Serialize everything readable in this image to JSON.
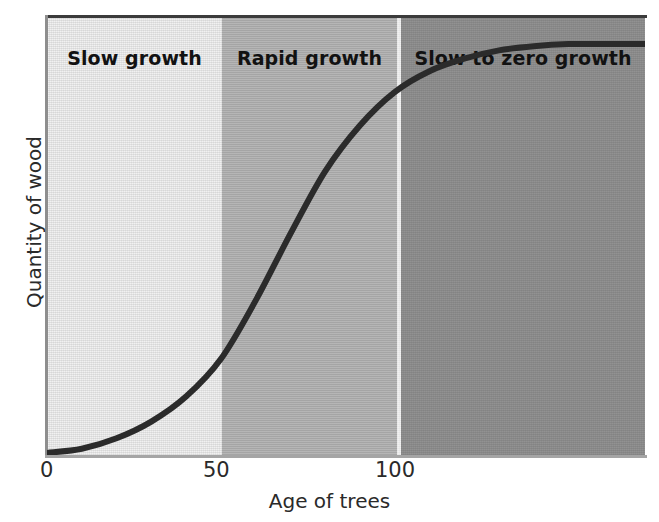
{
  "chart_data": {
    "type": "line",
    "title": "",
    "xlabel": "Age of trees",
    "ylabel": "Quantity of wood",
    "xlim": [
      0,
      172
    ],
    "ylim": [
      0,
      1.05
    ],
    "grid": false,
    "legend": "none",
    "xticks": [
      "0",
      "50",
      "100"
    ],
    "xtick_values": [
      0,
      50,
      100
    ],
    "yticks": [],
    "series": [
      {
        "name": "Quantity of wood vs age of trees",
        "description": "Sigmoid growth curve",
        "x": [
          0,
          10,
          20,
          30,
          40,
          50,
          60,
          70,
          80,
          90,
          100,
          110,
          120,
          130,
          140,
          150,
          160,
          172
        ],
        "y": [
          0.005,
          0.015,
          0.04,
          0.08,
          0.14,
          0.23,
          0.37,
          0.53,
          0.68,
          0.79,
          0.87,
          0.92,
          0.95,
          0.97,
          0.98,
          0.985,
          0.985,
          0.985
        ]
      }
    ],
    "shaded_regions": [
      {
        "label": "Slow growth",
        "x_start": 0,
        "x_end": 50,
        "color": "#f1f1f1"
      },
      {
        "label": "Rapid growth",
        "x_start": 50,
        "x_end": 100,
        "color": "#b3b3b3"
      },
      {
        "label": "Slow to zero growth",
        "x_start": 100,
        "x_end": 172,
        "color": "#8b8b8b"
      }
    ],
    "line_color": "#2b2b2b"
  },
  "axes": {
    "x_title": "Age of trees",
    "y_title": "Quantity of wood",
    "x_tick_0": "0",
    "x_tick_50": "50",
    "x_tick_100": "100"
  },
  "regions": {
    "band_1_label": "Slow growth",
    "band_2_label": "Rapid growth",
    "band_3_label": "Slow to zero growth"
  },
  "colors": {
    "band_1": "#f1f1f1",
    "band_2": "#b3b3b3",
    "band_3": "#8b8b8b",
    "divider": "#fdfdfd",
    "curve": "#2b2b2b",
    "text": "#1b1b1b",
    "background": "#ffffff"
  }
}
